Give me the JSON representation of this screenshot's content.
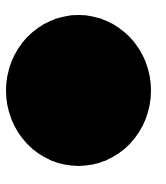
{
  "shape": {
    "type": "circle",
    "color": "#000000"
  },
  "background": "#ffffff"
}
